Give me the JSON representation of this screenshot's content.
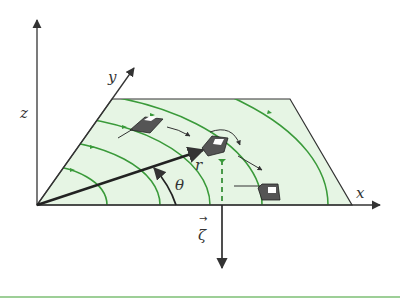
{
  "diagram": {
    "axes": {
      "x_label": "x",
      "y_label": "y",
      "z_label": "z"
    },
    "vector_labels": {
      "position": "r",
      "angle": "θ",
      "zeta": "ζ",
      "zeta_arrow": "→"
    },
    "colors": {
      "plane_fill": "#e6f5e4",
      "field_line": "#3a9a3a",
      "axis": "#333333",
      "bottom_rule": "#7cbf74"
    },
    "elements": [
      "plane",
      "concentric field lines",
      "three tilted plate objects",
      "position vector r",
      "angle arc θ",
      "downward vector ζ",
      "dashed projection line"
    ]
  }
}
